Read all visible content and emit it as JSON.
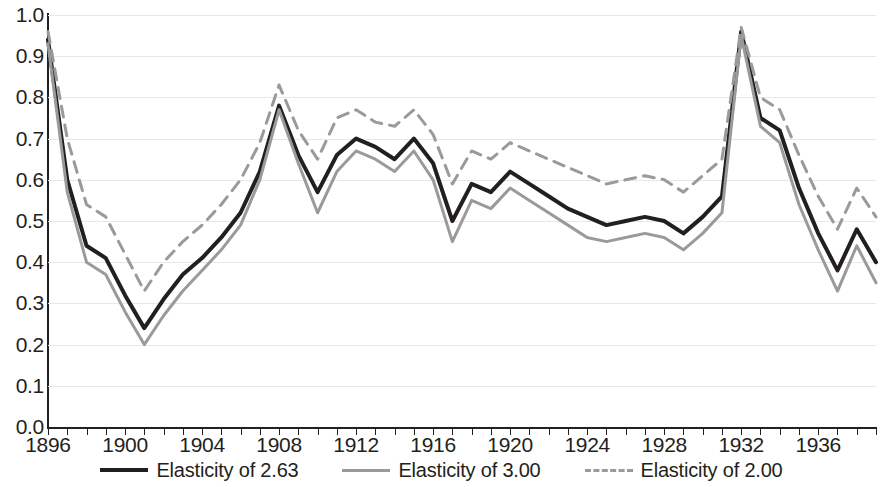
{
  "chart_data": {
    "type": "line",
    "title": "",
    "subtitle": "",
    "xlabel": "",
    "ylabel": "",
    "xlim": [
      1896,
      1939
    ],
    "ylim": [
      0.0,
      1.0
    ],
    "grid": true,
    "legend_position": "bottom",
    "y_ticks": [
      "1.0",
      "0.9",
      "0.8",
      "0.7",
      "0.6",
      "0.5",
      "0.4",
      "0.3",
      "0.2",
      "0.1",
      "0.0"
    ],
    "y_tick_values": [
      1.0,
      0.9,
      0.8,
      0.7,
      0.6,
      0.5,
      0.4,
      0.3,
      0.2,
      0.1,
      0.0
    ],
    "x_ticks": [
      "1896",
      "1900",
      "1904",
      "1908",
      "1912",
      "1916",
      "1920",
      "1924",
      "1928",
      "1932",
      "1936"
    ],
    "x_tick_values": [
      1896,
      1900,
      1904,
      1908,
      1912,
      1916,
      1920,
      1924,
      1928,
      1932,
      1936
    ],
    "x": [
      1896,
      1897,
      1898,
      1899,
      1900,
      1901,
      1902,
      1903,
      1904,
      1905,
      1906,
      1907,
      1908,
      1909,
      1910,
      1911,
      1912,
      1913,
      1914,
      1915,
      1916,
      1917,
      1918,
      1919,
      1920,
      1921,
      1922,
      1923,
      1924,
      1925,
      1926,
      1927,
      1928,
      1929,
      1930,
      1931,
      1932,
      1933,
      1934,
      1935,
      1936,
      1937,
      1938,
      1939
    ],
    "series": [
      {
        "name": "Elasticity of 2.63",
        "style": "solid",
        "color": "#231f20",
        "width": 4,
        "values": [
          0.94,
          0.6,
          0.44,
          0.41,
          0.32,
          0.24,
          0.31,
          0.37,
          0.41,
          0.46,
          0.52,
          0.62,
          0.78,
          0.66,
          0.57,
          0.66,
          0.7,
          0.68,
          0.65,
          0.7,
          0.64,
          0.5,
          0.59,
          0.57,
          0.62,
          0.59,
          0.56,
          0.53,
          0.51,
          0.49,
          0.5,
          0.51,
          0.5,
          0.47,
          0.51,
          0.56,
          0.96,
          0.75,
          0.72,
          0.58,
          0.47,
          0.38,
          0.48,
          0.4
        ]
      },
      {
        "name": "Elasticity of 3.00",
        "style": "solid",
        "color": "#9a9a9a",
        "width": 3,
        "values": [
          0.93,
          0.57,
          0.4,
          0.37,
          0.28,
          0.2,
          0.27,
          0.33,
          0.38,
          0.43,
          0.49,
          0.6,
          0.77,
          0.64,
          0.52,
          0.62,
          0.67,
          0.65,
          0.62,
          0.67,
          0.6,
          0.45,
          0.55,
          0.53,
          0.58,
          0.55,
          0.52,
          0.49,
          0.46,
          0.45,
          0.46,
          0.47,
          0.46,
          0.43,
          0.47,
          0.52,
          0.95,
          0.73,
          0.69,
          0.54,
          0.43,
          0.33,
          0.44,
          0.35
        ]
      },
      {
        "name": "Elasticity of 2.00",
        "style": "dashed",
        "color": "#9a9a9a",
        "width": 3,
        "values": [
          0.96,
          0.7,
          0.54,
          0.51,
          0.42,
          0.33,
          0.4,
          0.45,
          0.49,
          0.54,
          0.6,
          0.69,
          0.83,
          0.72,
          0.65,
          0.75,
          0.77,
          0.74,
          0.73,
          0.77,
          0.71,
          0.59,
          0.67,
          0.65,
          0.69,
          0.67,
          0.65,
          0.63,
          0.61,
          0.59,
          0.6,
          0.61,
          0.6,
          0.57,
          0.61,
          0.65,
          0.97,
          0.8,
          0.77,
          0.66,
          0.56,
          0.48,
          0.58,
          0.51
        ]
      }
    ]
  },
  "legend": {
    "items": [
      {
        "label": "Elasticity of 2.63",
        "swatch": "solid-dark"
      },
      {
        "label": "Elasticity of 3.00",
        "swatch": "solid-gray"
      },
      {
        "label": "Elasticity of 2.00",
        "swatch": "dashed-gray"
      }
    ]
  },
  "colors": {
    "series_dark": "#231f20",
    "series_gray": "#9a9a9a",
    "gridline": "#e8e8ea",
    "axis": "#231f20",
    "background": "#ffffff"
  }
}
